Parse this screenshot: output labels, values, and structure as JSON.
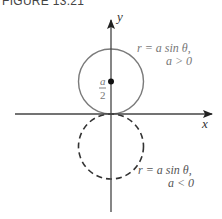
{
  "caption": "FIGURE 13.21",
  "axes": {
    "x_label": "x",
    "y_label": "y"
  },
  "curves": [
    {
      "name": "upper-circle",
      "equation": "r = a sin θ,",
      "condition": "a > 0",
      "style": "solid",
      "color": "#7a7a7a"
    },
    {
      "name": "lower-circle",
      "equation": "r = a sin θ,",
      "condition": "a < 0",
      "style": "dashed",
      "color": "#333333"
    }
  ],
  "center_marker": {
    "label_numerator": "a",
    "label_denominator": "2"
  }
}
